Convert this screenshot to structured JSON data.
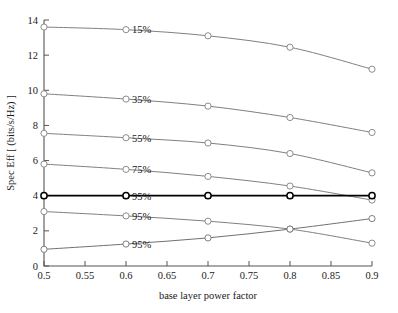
{
  "chart_data": {
    "type": "line",
    "title": "",
    "xlabel": "base layer power factor",
    "ylabel": "Spec Eff [ (bits/s/Hz) ]",
    "x": [
      0.5,
      0.6,
      0.7,
      0.8,
      0.9
    ],
    "xlim": [
      0.5,
      0.9
    ],
    "ylim": [
      0,
      14
    ],
    "xticks": [
      0.5,
      0.55,
      0.6,
      0.65,
      0.7,
      0.75,
      0.8,
      0.85,
      0.9
    ],
    "xticklabels": [
      "0.5",
      "0.55",
      "0.6",
      "0.65",
      "0.7",
      "0.75",
      "0.8",
      "0.85",
      "0.9"
    ],
    "yticks": [
      0,
      2,
      4,
      6,
      8,
      10,
      12,
      14
    ],
    "yticklabels": [
      "0",
      "2",
      "4",
      "6",
      "8",
      "10",
      "12",
      "14"
    ],
    "grid": false,
    "legend": "inline-annotations",
    "marker": "circle-open",
    "series": [
      {
        "name": "15%",
        "label": "15%",
        "label_x": 0.6,
        "color": "#808080",
        "linewidth": 1.0,
        "values": [
          13.6,
          13.45,
          13.1,
          12.45,
          11.2
        ]
      },
      {
        "name": "35%",
        "label": "35%",
        "label_x": 0.6,
        "color": "#808080",
        "linewidth": 1.0,
        "values": [
          9.8,
          9.5,
          9.1,
          8.45,
          7.6
        ]
      },
      {
        "name": "55%",
        "label": "55%",
        "label_x": 0.6,
        "color": "#808080",
        "linewidth": 1.0,
        "values": [
          7.55,
          7.3,
          7.0,
          6.4,
          5.3
        ]
      },
      {
        "name": "75%",
        "label": "75%",
        "label_x": 0.6,
        "color": "#808080",
        "linewidth": 1.0,
        "values": [
          5.8,
          5.5,
          5.1,
          4.55,
          3.75
        ]
      },
      {
        "name": "95%-flat",
        "label": "95%",
        "label_x": 0.6,
        "color": "#000000",
        "linewidth": 1.7,
        "values": [
          4.0,
          4.0,
          4.0,
          4.0,
          4.0
        ]
      },
      {
        "name": "95%-decreasing",
        "label": "95%",
        "label_x": 0.6,
        "color": "#808080",
        "linewidth": 1.0,
        "values": [
          3.1,
          2.85,
          2.55,
          2.1,
          1.3
        ]
      },
      {
        "name": "95%-increasing",
        "label": "95%",
        "label_x": 0.6,
        "color": "#707070",
        "linewidth": 1.0,
        "values": [
          0.95,
          1.25,
          1.6,
          2.1,
          2.7
        ]
      }
    ]
  }
}
